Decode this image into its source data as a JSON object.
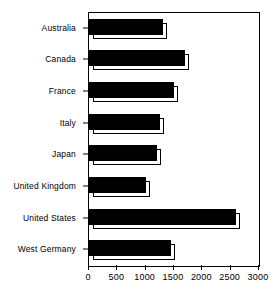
{
  "chart_data": {
    "type": "bar",
    "orientation": "horizontal",
    "title": "",
    "xlabel": "",
    "ylabel": "",
    "categories": [
      "Australia",
      "Canada",
      "France",
      "Italy",
      "Japan",
      "United Kingdom",
      "United States",
      "West Germany"
    ],
    "values": [
      1300,
      1700,
      1500,
      1250,
      1200,
      1000,
      2600,
      1450
    ],
    "xlim": [
      0,
      3000
    ],
    "xticks": [
      0,
      500,
      1000,
      1500,
      2000,
      2500,
      3000
    ],
    "xtick_labels": [
      "0",
      "500",
      "1000",
      "1500",
      "2000",
      "2500",
      "3000"
    ],
    "grid": false,
    "legend": null,
    "bar_style": "3d-extruded",
    "bar_color": "#000000",
    "bar_extrude_color": "#ffffff",
    "frame_color": "#000000",
    "background": "#ffffff"
  }
}
